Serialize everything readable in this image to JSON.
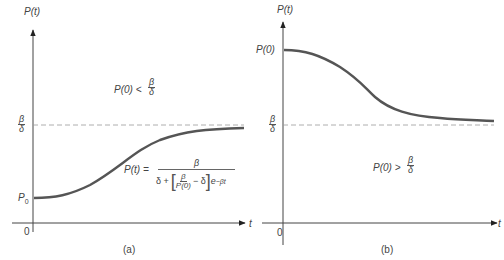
{
  "panel_a": {
    "y_axis_label": "P(t)",
    "x_axis_label": "t",
    "origin_label": "0",
    "p0_label": "P",
    "p0_sub": "0",
    "equilibrium_num": "β",
    "equilibrium_den": "δ",
    "condition_lhs": "P(0) <",
    "condition_num": "β",
    "condition_den": "δ",
    "formula_lhs": "P(t) =",
    "formula_num": "β",
    "formula_den_prefix": "δ +",
    "formula_inner_num": "β",
    "formula_inner_den": "P(0)",
    "formula_inner_minus": "− δ",
    "formula_exp_base": "e",
    "formula_exp": "−βt",
    "caption": "(a)",
    "curve": "logistic increasing from P0 toward β/δ"
  },
  "panel_b": {
    "y_axis_label": "P(t)",
    "x_axis_label": "t",
    "origin_label": "0",
    "p0_label": "P(0)",
    "equilibrium_num": "β",
    "equilibrium_den": "δ",
    "condition_lhs": "P(0) >",
    "condition_num": "β",
    "condition_den": "δ",
    "caption": "(b)",
    "curve": "decreasing from P(0) toward β/δ"
  },
  "colors": {
    "curve": "#555555",
    "axis": "#444444",
    "dashed": "#888888"
  }
}
